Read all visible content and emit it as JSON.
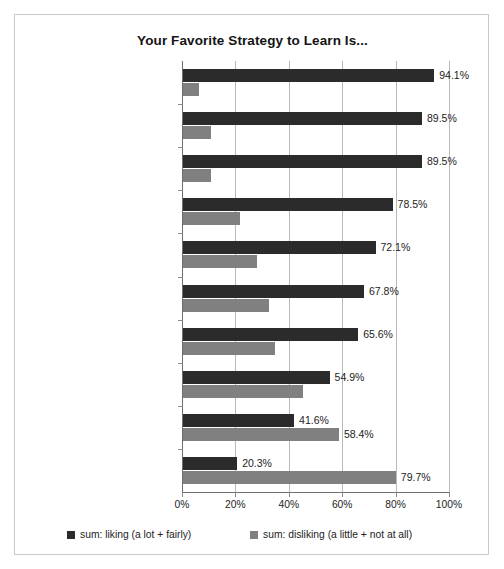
{
  "chart_data": {
    "type": "bar",
    "orientation": "horizontal",
    "title": "Your Favorite Strategy to Learn Is...",
    "xlabel": "",
    "ylabel": "",
    "xlim": [
      0,
      100
    ],
    "xticks": [
      "0%",
      "20%",
      "40%",
      "60%",
      "80%",
      "100%"
    ],
    "xtick_values": [
      0,
      20,
      40,
      60,
      80,
      100
    ],
    "grid": true,
    "legend_position": "bottom",
    "categories": [
      "Lectures in classroom",
      "Individual study (using books, notes, folders)",
      "Search engines",
      "Wikipedia",
      "Online platforms (e-learning)",
      "Websites/specialized blogs",
      "Individual locconc",
      "Printed dictionaries/encyclopedias",
      "Multimedia supports",
      "Social networking sites"
    ],
    "series": [
      {
        "name": "sum: liking (a lot + fairly)",
        "color": "#2b2b2b",
        "values": [
          94.1,
          89.5,
          89.5,
          78.5,
          72.1,
          67.8,
          65.6,
          54.9,
          41.6,
          20.3
        ],
        "labels": [
          "94.1%",
          "89.5%",
          "89.5%",
          "78.5%",
          "72.1%",
          "67.8%",
          "65.6%",
          "54.9%",
          "41.6%",
          "20.3%"
        ]
      },
      {
        "name": "sum: disliking (a little + not at all)",
        "color": "#808080",
        "values": [
          5.9,
          10.5,
          10.5,
          21.5,
          27.9,
          32.2,
          34.4,
          45.1,
          58.4,
          79.7
        ],
        "labels": [
          "",
          "",
          "",
          "",
          "",
          "",
          "",
          "",
          "58.4%",
          "79.7%"
        ]
      }
    ]
  },
  "legend": {
    "items": [
      {
        "label": "sum: liking (a lot + fairly)",
        "color": "#2b2b2b"
      },
      {
        "label": "sum: disliking (a little + not at all)",
        "color": "#808080"
      }
    ]
  }
}
